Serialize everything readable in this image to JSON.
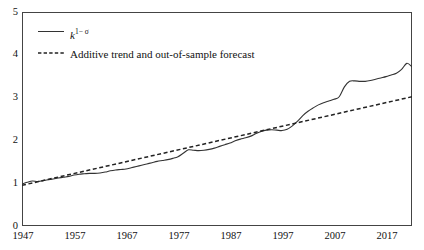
{
  "chart_data": {
    "type": "line",
    "title": "",
    "xlabel": "",
    "ylabel": "",
    "xlim": [
      1947,
      2022
    ],
    "ylim": [
      0,
      5
    ],
    "grid": false,
    "legend_position": "top-left",
    "xticks": [
      "1947",
      "1957",
      "1967",
      "1977",
      "1987",
      "1997",
      "2007",
      "2017"
    ],
    "xtick_values": [
      1947,
      1957,
      1967,
      1977,
      1987,
      1997,
      2007,
      2017
    ],
    "yticks": [
      "0",
      "1",
      "2",
      "3",
      "4",
      "5"
    ],
    "ytick_values": [
      0,
      1,
      2,
      3,
      4,
      5
    ],
    "series": [
      {
        "name": "k 1-σ",
        "style": "solid",
        "color": "#333333",
        "x": [
          1947,
          1948,
          1949,
          1950,
          1951,
          1952,
          1953,
          1954,
          1955,
          1956,
          1957,
          1958,
          1959,
          1960,
          1961,
          1962,
          1963,
          1964,
          1965,
          1966,
          1967,
          1968,
          1969,
          1970,
          1971,
          1972,
          1973,
          1974,
          1975,
          1976,
          1977,
          1978,
          1979,
          1980,
          1981,
          1982,
          1983,
          1984,
          1985,
          1986,
          1987,
          1988,
          1989,
          1990,
          1991,
          1992,
          1993,
          1994,
          1995,
          1996,
          1997,
          1998,
          1999,
          2000,
          2001,
          2002,
          2003,
          2004,
          2005,
          2006,
          2007,
          2008,
          2009,
          2010,
          2011,
          2012,
          2013,
          2014,
          2015,
          2016,
          2017,
          2018,
          2019,
          2020,
          2021,
          2022
        ],
        "values": [
          0.98,
          1.02,
          1.05,
          1.04,
          1.06,
          1.08,
          1.1,
          1.12,
          1.14,
          1.16,
          1.19,
          1.21,
          1.22,
          1.23,
          1.23,
          1.24,
          1.26,
          1.29,
          1.31,
          1.32,
          1.33,
          1.36,
          1.39,
          1.42,
          1.45,
          1.48,
          1.51,
          1.53,
          1.55,
          1.58,
          1.62,
          1.7,
          1.78,
          1.77,
          1.76,
          1.77,
          1.79,
          1.82,
          1.86,
          1.9,
          1.94,
          1.99,
          2.03,
          2.06,
          2.1,
          2.16,
          2.21,
          2.24,
          2.25,
          2.24,
          2.23,
          2.26,
          2.34,
          2.45,
          2.58,
          2.68,
          2.76,
          2.83,
          2.88,
          2.92,
          2.96,
          3.02,
          3.25,
          3.38,
          3.39,
          3.38,
          3.38,
          3.4,
          3.43,
          3.46,
          3.49,
          3.53,
          3.57,
          3.66,
          3.8,
          3.72
        ]
      },
      {
        "name": "Additive trend and out-of-sample forecast",
        "style": "dashed",
        "color": "#222222",
        "x": [
          1947,
          2022
        ],
        "values": [
          0.95,
          3.02
        ]
      }
    ]
  },
  "legend": {
    "items": [
      {
        "label_prefix": "k",
        "label_sup": "1− σ",
        "style": "solid"
      },
      {
        "label": "Additive trend and out-of-sample forecast",
        "style": "dashed"
      }
    ]
  },
  "axes": {
    "y_labels": [
      "5",
      "4",
      "3",
      "2",
      "1",
      "0"
    ],
    "x_labels": [
      "1947",
      "1957",
      "1967",
      "1977",
      "1987",
      "1997",
      "2007",
      "2017"
    ]
  },
  "colors": {
    "frame": "#444444",
    "solid_line": "#333333",
    "dashed_line": "#222222",
    "text": "#111111",
    "background": "#ffffff"
  }
}
